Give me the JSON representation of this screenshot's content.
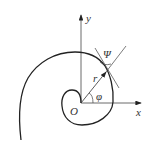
{
  "diagram": {
    "type": "logarithmic-spiral polar coordinates",
    "labels": {
      "y_axis": "y",
      "x_axis": "x",
      "origin": "O",
      "radius": "r",
      "polar_angle": "φ",
      "tangent_angle": "Ψ"
    },
    "colors": {
      "stroke": "#222222",
      "background": "#ffffff"
    }
  }
}
